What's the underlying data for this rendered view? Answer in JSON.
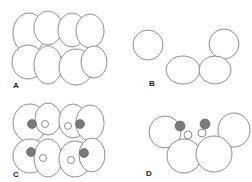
{
  "figure": {
    "panels": [
      {
        "id": "A",
        "label": "A",
        "description": "Cluster of eight rounded cells in two rows of four, no inclusions"
      },
      {
        "id": "B",
        "label": "B",
        "description": "Four rounded cells in a chain: two upper outer cells, two lower central cells"
      },
      {
        "id": "C",
        "label": "C",
        "description": "Eight-cell cluster, four cells containing a dark granule and a clear vacuole"
      },
      {
        "id": "D",
        "label": "D",
        "description": "Four-cell chain with two dark granules and two clear vacuoles between cells"
      }
    ],
    "colors": {
      "outline": "#6e6e6e",
      "granule": "#7a7a7a",
      "background": "#ffffff",
      "label": "#222222"
    }
  }
}
